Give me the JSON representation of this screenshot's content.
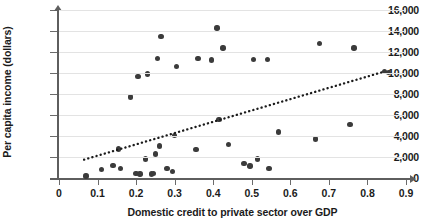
{
  "chart_data": {
    "type": "scatter",
    "title": "",
    "xlabel": "Domestic credit to private sector over GDP",
    "ylabel": "Per capita income (dollars)",
    "xlim": [
      0,
      0.9
    ],
    "ylim": [
      0,
      16000
    ],
    "grid": true,
    "legend": "none",
    "xticks": [
      "0",
      "0.1",
      "0.2",
      "0.3",
      "0.4",
      "0.5",
      "0.6",
      "0.7",
      "0.8",
      "0.9"
    ],
    "xtick_values": [
      0,
      0.1,
      0.2,
      0.3,
      0.4,
      0.5,
      0.6,
      0.7,
      0.8,
      0.9
    ],
    "yticks": [
      "0",
      "2,000",
      "4,000",
      "6,000",
      "8,000",
      "10,000",
      "12,000",
      "14,000",
      "16,000"
    ],
    "ytick_values": [
      0,
      2000,
      4000,
      6000,
      8000,
      10000,
      12000,
      14000,
      16000
    ],
    "point_color": "#3b3b3b",
    "trendline_color": "#1b1b1b",
    "trendline_style": "dotted",
    "trendline": {
      "x_start": 0.065,
      "y_start": 1750,
      "x_end": 0.845,
      "y_end": 10150
    },
    "points": [
      {
        "x": 0.07,
        "y": 200
      },
      {
        "x": 0.11,
        "y": 800
      },
      {
        "x": 0.14,
        "y": 1200
      },
      {
        "x": 0.155,
        "y": 2750
      },
      {
        "x": 0.16,
        "y": 900
      },
      {
        "x": 0.185,
        "y": 7700
      },
      {
        "x": 0.2,
        "y": 450
      },
      {
        "x": 0.205,
        "y": 9650
      },
      {
        "x": 0.21,
        "y": 400
      },
      {
        "x": 0.225,
        "y": 1800
      },
      {
        "x": 0.23,
        "y": 9900
      },
      {
        "x": 0.24,
        "y": 400
      },
      {
        "x": 0.245,
        "y": 420
      },
      {
        "x": 0.25,
        "y": 2300
      },
      {
        "x": 0.255,
        "y": 11400
      },
      {
        "x": 0.26,
        "y": 3050
      },
      {
        "x": 0.265,
        "y": 13500
      },
      {
        "x": 0.28,
        "y": 900
      },
      {
        "x": 0.295,
        "y": 600
      },
      {
        "x": 0.3,
        "y": 4050
      },
      {
        "x": 0.305,
        "y": 10600
      },
      {
        "x": 0.355,
        "y": 2700
      },
      {
        "x": 0.36,
        "y": 11400
      },
      {
        "x": 0.395,
        "y": 11250
      },
      {
        "x": 0.41,
        "y": 14300
      },
      {
        "x": 0.415,
        "y": 5600
      },
      {
        "x": 0.425,
        "y": 12400
      },
      {
        "x": 0.44,
        "y": 3200
      },
      {
        "x": 0.48,
        "y": 1400
      },
      {
        "x": 0.495,
        "y": 1150
      },
      {
        "x": 0.505,
        "y": 11300
      },
      {
        "x": 0.515,
        "y": 1800
      },
      {
        "x": 0.54,
        "y": 11300
      },
      {
        "x": 0.545,
        "y": 900
      },
      {
        "x": 0.57,
        "y": 4400
      },
      {
        "x": 0.665,
        "y": 3700
      },
      {
        "x": 0.675,
        "y": 12800
      },
      {
        "x": 0.755,
        "y": 5100
      },
      {
        "x": 0.765,
        "y": 12400
      },
      {
        "x": 0.845,
        "y": 10150
      },
      {
        "x": 0.855,
        "y": 10050
      }
    ]
  }
}
